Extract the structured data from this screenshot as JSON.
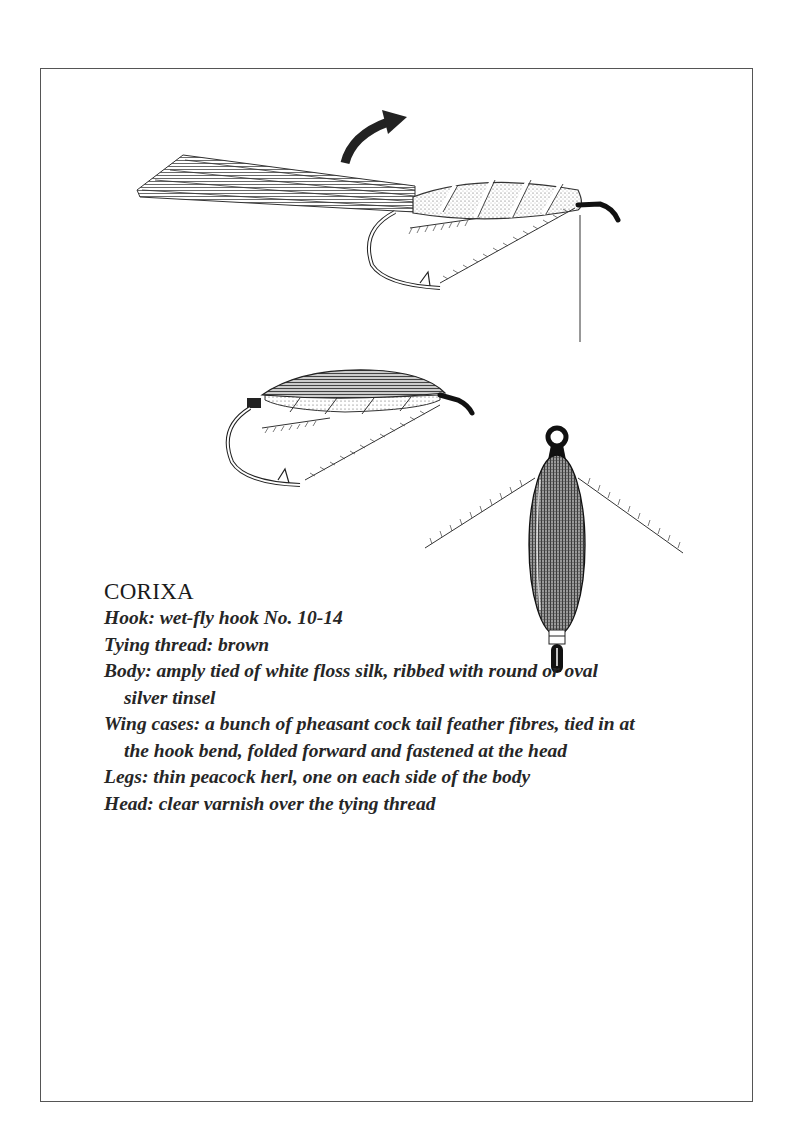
{
  "page": {
    "background": "#ffffff",
    "frame_color": "#555555"
  },
  "illustrations": [
    {
      "name": "step-1-wing-case-fibres-tied-in",
      "description": "Hook with silk body ribbed with tinsel, pheasant tail fibres extended backward, curved arrow indicating folding forward, hanging tying thread"
    },
    {
      "name": "step-2-wing-case-folded-forward",
      "description": "Side view of finished fly with wing case folded over the body, legs beneath"
    },
    {
      "name": "top-view-finished-corixa",
      "description": "Top view of finished corixa with oval body and two peacock herl legs"
    }
  ],
  "recipe": {
    "title": "CORIXA",
    "lines": [
      {
        "label": "Hook",
        "text": "Hook: wet-fly hook No. 10-14"
      },
      {
        "label": "Tying thread",
        "text": "Tying thread: brown"
      },
      {
        "label": "Body",
        "text": "Body: amply tied of white floss silk, ribbed with round or oval silver tinsel"
      },
      {
        "label": "Wing cases",
        "text": "Wing cases: a bunch of pheasant cock tail feather fibres, tied in at the hook bend, folded forward and fastened at the head"
      },
      {
        "label": "Legs",
        "text": "Legs: thin peacock herl, one on each side of the body"
      },
      {
        "label": "Head",
        "text": "Head: clear varnish over the tying thread"
      }
    ]
  }
}
